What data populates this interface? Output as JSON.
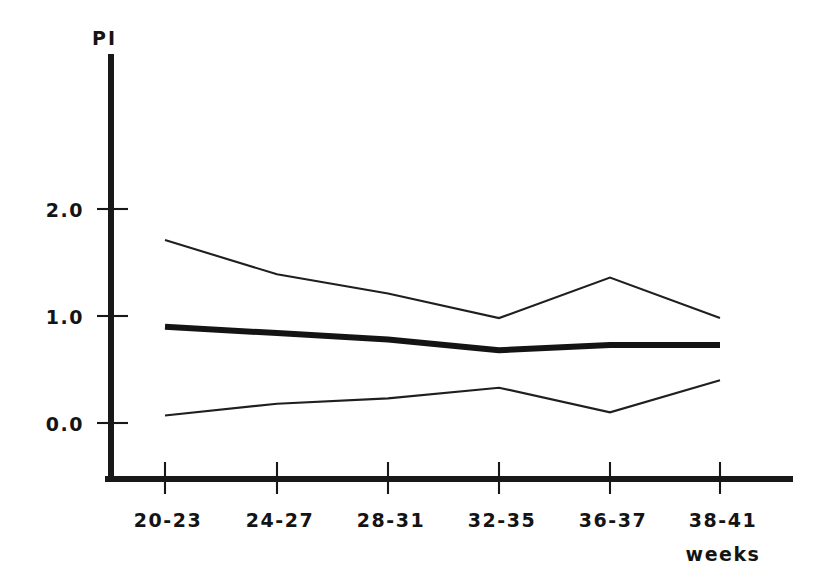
{
  "chart_data": {
    "type": "line",
    "title": "",
    "ylabel": "PI",
    "xlabel": "weeks",
    "categories": [
      "20-23",
      "24-27",
      "28-31",
      "32-35",
      "36-37",
      "38-41"
    ],
    "yticks": [
      "0.0",
      "1.0",
      "2.0"
    ],
    "ytick_values": [
      0.0,
      1.0,
      2.0
    ],
    "ylim": [
      -0.5,
      2.6
    ],
    "grid": false,
    "legend": "none",
    "series": [
      {
        "name": "upper-reference-limit",
        "style": "thin",
        "values": [
          1.71,
          1.39,
          1.21,
          0.98,
          1.36,
          0.98
        ]
      },
      {
        "name": "mean",
        "style": "thick",
        "values": [
          0.9,
          0.84,
          0.78,
          0.68,
          0.73,
          0.73
        ]
      },
      {
        "name": "lower-reference-limit",
        "style": "thin",
        "values": [
          0.07,
          0.18,
          0.23,
          0.33,
          0.1,
          0.4
        ]
      }
    ]
  },
  "colors": {
    "ink": "#141414",
    "background": "#ffffff"
  }
}
